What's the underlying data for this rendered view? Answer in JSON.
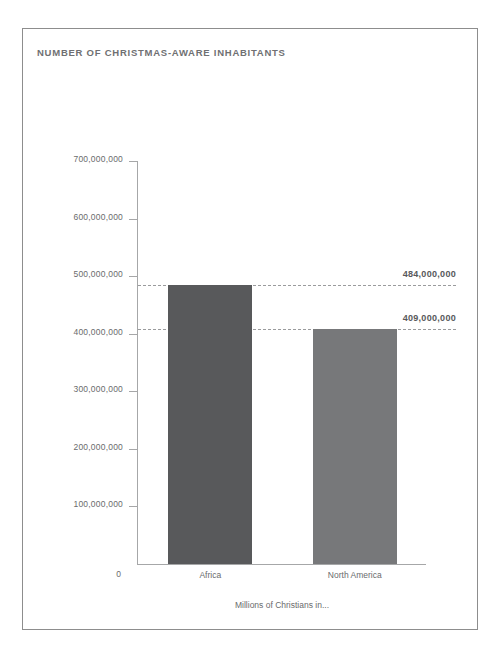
{
  "figure": {
    "title": "NUMBER OF CHRISTMAS-AWARE INHABITANTS",
    "title_color": "#6f7072",
    "frame_color": "#8d8d8d",
    "axis_color": "#a6a7a8",
    "tick_label_color": "#6a6b6d",
    "zero_label": "0"
  },
  "chart_data": {
    "type": "bar",
    "title": "NUMBER OF CHRISTMAS-AWARE INHABITANTS",
    "xlabel": "Millions of Christians in...",
    "ylabel": "",
    "categories": [
      "Africa",
      "North America"
    ],
    "values": [
      484000000,
      409000000
    ],
    "value_labels": [
      "484,000,000",
      "409,000,000"
    ],
    "bar_colors": [
      "#58595b",
      "#77787a"
    ],
    "ylim": [
      0,
      700000000
    ],
    "yticks": [
      0,
      100000000,
      200000000,
      300000000,
      400000000,
      500000000,
      600000000,
      700000000
    ],
    "ytick_labels": [
      "0",
      "100,000,000",
      "200,000,000",
      "300,000,000",
      "400,000,000",
      "500,000,000",
      "600,000,000",
      "700,000,000"
    ],
    "grid": false,
    "legend": null,
    "reference_lines": [
      {
        "value": 484000000,
        "label": "484,000,000",
        "style": "dashed"
      },
      {
        "value": 409000000,
        "label": "409,000,000",
        "style": "dashed"
      }
    ]
  }
}
